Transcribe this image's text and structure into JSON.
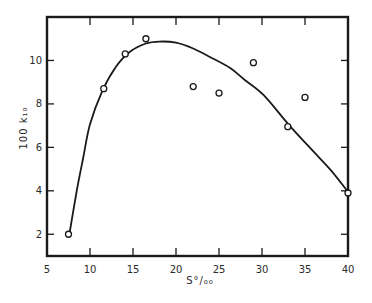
{
  "chart_data": {
    "type": "scatter",
    "title": "",
    "xlabel": "S°/₀₀",
    "ylabel": "100 k₁₀",
    "xlim": [
      5,
      40
    ],
    "ylim": [
      1,
      12
    ],
    "x_ticks": [
      5,
      10,
      15,
      20,
      25,
      30,
      35,
      40
    ],
    "y_ticks": [
      2,
      4,
      6,
      8,
      10
    ],
    "x_tick_labels": [
      "5",
      "10",
      "15",
      "20",
      "25",
      "30",
      "35",
      "40"
    ],
    "y_tick_labels": [
      "2",
      "4",
      "6",
      "8",
      "10"
    ],
    "grid": false,
    "legend": "none",
    "series": [
      {
        "name": "observed",
        "kind": "points",
        "marker": "open-circle",
        "x": [
          7.5,
          11.6,
          14.1,
          16.5,
          22.0,
          25.0,
          29.0,
          33.0,
          35.0,
          40.0
        ],
        "y": [
          2.0,
          8.7,
          10.3,
          11.0,
          8.8,
          8.5,
          9.9,
          6.95,
          8.3,
          3.9
        ]
      },
      {
        "name": "fitted curve",
        "kind": "line",
        "x": [
          7.6,
          8.45,
          9.2,
          10.0,
          11.4,
          13.0,
          14.65,
          16.5,
          18.1,
          20.0,
          22.0,
          24.0,
          26.3,
          28.0,
          30.2,
          33.1,
          36.0,
          38.0,
          40.0
        ],
        "y": [
          2.0,
          3.98,
          5.5,
          7.06,
          8.57,
          9.7,
          10.4,
          10.78,
          10.87,
          10.82,
          10.55,
          10.15,
          9.65,
          9.1,
          8.4,
          7.05,
          5.8,
          4.95,
          3.95
        ]
      }
    ]
  }
}
